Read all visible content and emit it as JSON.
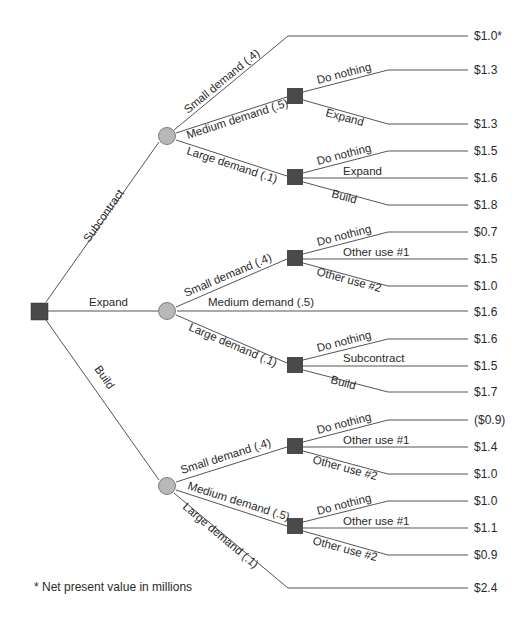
{
  "diagram": {
    "type": "decision-tree",
    "footnote": "* Net present value in millions",
    "colors": {
      "decision_node": "#4a4a4a",
      "chance_node": "#b8b8b8",
      "edge": "#555555",
      "text": "#2a2a2a"
    },
    "root": {
      "type": "decision",
      "alternatives": [
        {
          "label": "Subcontract",
          "node": "chance",
          "outcomes": [
            {
              "label": "Small demand (.4)",
              "value": "$1.0*"
            },
            {
              "label": "Medium demand (.5)",
              "decision": [
                {
                  "label": "Do nothing",
                  "value": "$1.3"
                },
                {
                  "label": "Expand",
                  "value": "$1.3"
                }
              ]
            },
            {
              "label": "Large demand (.1)",
              "decision": [
                {
                  "label": "Do nothing",
                  "value": "$1.5"
                },
                {
                  "label": "Expand",
                  "value": "$1.6"
                },
                {
                  "label": "Build",
                  "value": "$1.8"
                }
              ]
            }
          ]
        },
        {
          "label": "Expand",
          "node": "chance",
          "outcomes": [
            {
              "label": "Small demand (.4)",
              "decision": [
                {
                  "label": "Do nothing",
                  "value": "$0.7"
                },
                {
                  "label": "Other use #1",
                  "value": "$1.5"
                },
                {
                  "label": "Other use #2",
                  "value": "$1.0"
                }
              ]
            },
            {
              "label": "Medium demand (.5)",
              "value": "$1.6"
            },
            {
              "label": "Large demand (.1)",
              "decision": [
                {
                  "label": "Do nothing",
                  "value": "$1.6"
                },
                {
                  "label": "Subcontract",
                  "value": "$1.5"
                },
                {
                  "label": "Build",
                  "value": "$1.7"
                }
              ]
            }
          ]
        },
        {
          "label": "Build",
          "node": "chance",
          "outcomes": [
            {
              "label": "Small demand (.4)",
              "decision": [
                {
                  "label": "Do nothing",
                  "value": "($0.9)"
                },
                {
                  "label": "Other use #1",
                  "value": "$1.4"
                },
                {
                  "label": "Other use #2",
                  "value": "$1.0"
                }
              ]
            },
            {
              "label": "Medium demand (.5)",
              "decision": [
                {
                  "label": "Do nothing",
                  "value": "$1.0"
                },
                {
                  "label": "Other use #1",
                  "value": "$1.1"
                },
                {
                  "label": "Other use #2",
                  "value": "$0.9"
                }
              ]
            },
            {
              "label": "Large demand (.1)",
              "value": "$2.4"
            }
          ]
        }
      ]
    }
  },
  "labels": {
    "root": {
      "subcontract": "Subcontract",
      "expand": "Expand",
      "build": "Build"
    },
    "sub": {
      "small": "Small demand (.4)",
      "medium": "Medium demand (.5)",
      "large": "Large demand (.1)",
      "med_do_nothing": "Do nothing",
      "med_expand": "Expand",
      "lg_do_nothing": "Do nothing",
      "lg_expand": "Expand",
      "lg_build": "Build"
    },
    "exp": {
      "small": "Small demand (.4)",
      "medium": "Medium demand (.5)",
      "large": "Large demand (.1)",
      "sm_do_nothing": "Do nothing",
      "sm_other1": "Other use #1",
      "sm_other2": "Other use #2",
      "lg_do_nothing": "Do nothing",
      "lg_subcontract": "Subcontract",
      "lg_build": "Build"
    },
    "bld": {
      "small": "Small demand (.4)",
      "medium": "Medium demand (.5)",
      "large": "Large demand (.1)",
      "sm_do_nothing": "Do nothing",
      "sm_other1": "Other use #1",
      "sm_other2": "Other use #2",
      "md_do_nothing": "Do nothing",
      "md_other1": "Other use #1",
      "md_other2": "Other use #2"
    }
  },
  "values": [
    "$1.0*",
    "$1.3",
    "$1.3",
    "$1.5",
    "$1.6",
    "$1.8",
    "$0.7",
    "$1.5",
    "$1.0",
    "$1.6",
    "$1.6",
    "$1.5",
    "$1.7",
    "($0.9)",
    "$1.4",
    "$1.0",
    "$1.0",
    "$1.1",
    "$0.9",
    "$2.4"
  ]
}
